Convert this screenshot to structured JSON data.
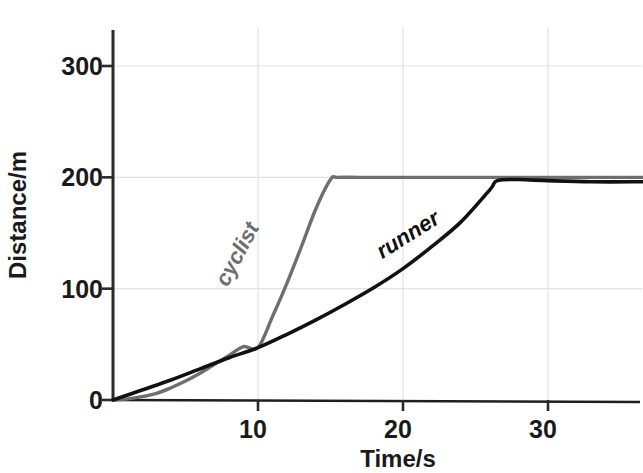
{
  "chart_data": {
    "type": "line",
    "title": "",
    "xlabel": "Time/s",
    "ylabel": "Distance/m",
    "xlim": [
      0,
      36.5
    ],
    "ylim": [
      0,
      335
    ],
    "xticks": [
      10,
      20,
      30
    ],
    "xtick_labels": [
      "10",
      "20",
      "30"
    ],
    "yticks": [
      0,
      100,
      200,
      300
    ],
    "ytick_labels": [
      "0",
      "100",
      "200",
      "300"
    ],
    "grid": true,
    "grid_color": "#e2e2e2",
    "legend_position": "inline-annotations",
    "series": [
      {
        "name": "cyclist",
        "label": "cyclist",
        "color": "#6e6e6e",
        "label_rotation": -62,
        "label_x": 9.0,
        "label_y": 128,
        "x": [
          0,
          1,
          2,
          3,
          4,
          5,
          6,
          7,
          8,
          9,
          10,
          11,
          12,
          13,
          14,
          15,
          15.5,
          17,
          20,
          25,
          30,
          36.5
        ],
        "y": [
          0,
          1,
          3,
          6,
          11,
          17,
          24,
          32,
          40,
          48,
          47,
          75,
          105,
          138,
          172,
          198,
          200,
          200,
          200,
          200,
          200,
          200
        ]
      },
      {
        "name": "runner",
        "label": "runner",
        "color": "#111111",
        "label_rotation": -32,
        "label_x": 20.6,
        "label_y": 143,
        "x": [
          0,
          2,
          4,
          6,
          8,
          10,
          12,
          14,
          16,
          18,
          20,
          22,
          24,
          26,
          26.5,
          28,
          30,
          33,
          36.5
        ],
        "y": [
          0,
          9,
          18,
          28,
          38,
          47,
          59,
          72,
          86,
          101,
          118,
          138,
          160,
          189,
          197,
          198,
          197,
          196,
          196
        ]
      }
    ],
    "annotations": [
      {
        "text": "cyclist",
        "series": "cyclist"
      },
      {
        "text": "runner",
        "series": "runner"
      }
    ]
  },
  "axes": {
    "x_title": "Time/s",
    "y_title": "Distance/m"
  }
}
